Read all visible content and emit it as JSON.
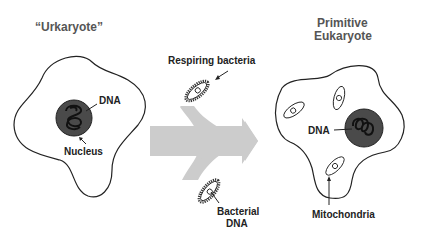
{
  "diagram": {
    "left_title": "“Urkaryote”",
    "right_title_line1": "Primitive",
    "right_title_line2": "Eukaryote",
    "left_labels": {
      "dna": "DNA",
      "nucleus": "Nucleus"
    },
    "middle_labels": {
      "respiring_bacteria": "Respiring bacteria",
      "bacterial_dna_line1": "Bacterial",
      "bacterial_dna_line2": "DNA"
    },
    "right_labels": {
      "dna": "DNA",
      "mitochondria": "Mitochondria"
    },
    "colors": {
      "outline": "#222222",
      "nucleus_fill": "#4a4a4a",
      "arrow_fill": "#cccccc",
      "title_text": "#555555"
    }
  }
}
